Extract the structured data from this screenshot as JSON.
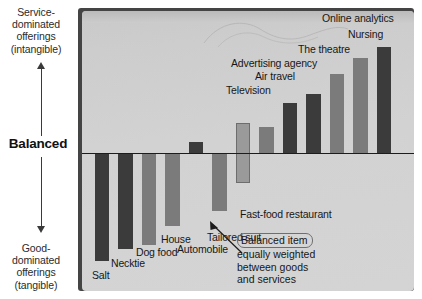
{
  "axes": {
    "top_label": "Service-\ndominated\nofferings\n(intangible)",
    "top_lines": [
      "Service-",
      "dominated",
      "offerings",
      "(intangible)"
    ],
    "middle_label": "Balanced",
    "bottom_lines": [
      "Good-",
      "dominated",
      "offerings",
      "(tangible)"
    ],
    "bottom_label": "Good-\ndominated\nofferings\n(tangible)"
  },
  "annotation": {
    "line1": "Balanced item",
    "line2": "equally weighted",
    "line3": "between goods",
    "line4": "and services"
  },
  "colors": {
    "dark_bar": "#3b3b3b",
    "mid_bar": "#7b7b7b",
    "light_bar": "#9a9a9a",
    "plate": "#d2d2d2",
    "baseline": "#1c1c1c"
  },
  "chart_data": {
    "type": "bar",
    "title": "",
    "subtitle": "",
    "xlabel": "",
    "ylabel": "Service-dominated (intangible) ↔ Good-dominated (tangible)",
    "ylim": [
      -100,
      100
    ],
    "grid": false,
    "legend": "none",
    "baseline": 0,
    "note": "Diverging bar chart: negative values extend below the 'Balanced' baseline (goods-dominated), positive values extend above (services-dominated).",
    "categories": [
      "Salt",
      "Necktie",
      "Dog food",
      "House",
      "Automobile",
      "Tailored suit",
      "Fast-food restaurant",
      "Television",
      "Air travel",
      "Advertising agency",
      "The theatre",
      "Nursing",
      "Online analytics"
    ],
    "values": [
      -82,
      -73,
      -70,
      -55,
      8,
      -44,
      0,
      20,
      38,
      45,
      60,
      72,
      80
    ],
    "shades": [
      "dark",
      "dark",
      "mid",
      "mid",
      "dark",
      "mid",
      "light",
      "mid",
      "dark",
      "dark",
      "mid",
      "mid",
      "dark"
    ],
    "labels": [
      {
        "name": "Salt",
        "value": -82
      },
      {
        "name": "Necktie",
        "value": -73
      },
      {
        "name": "Dog food",
        "value": -70
      },
      {
        "name": "House",
        "value": -55
      },
      {
        "name": "Automobile",
        "value": 8
      },
      {
        "name": "Tailored suit",
        "value": -44
      },
      {
        "name": "Fast-food restaurant",
        "value": 0
      },
      {
        "name": "Television",
        "value": 20
      },
      {
        "name": "Air travel",
        "value": 38
      },
      {
        "name": "Advertising agency",
        "value": 45
      },
      {
        "name": "The theatre",
        "value": 60
      },
      {
        "name": "Nursing",
        "value": 72
      },
      {
        "name": "Online analytics",
        "value": 80
      }
    ],
    "annotations": [
      {
        "target": "Fast-food restaurant",
        "text": "Balanced item equally weighted between goods and services"
      }
    ]
  }
}
